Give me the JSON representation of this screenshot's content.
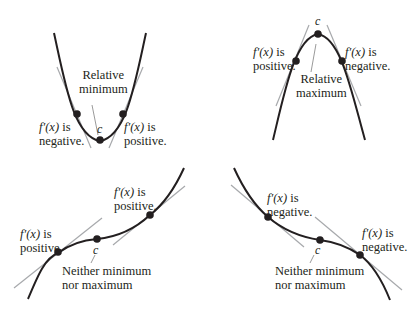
{
  "panels": [
    {
      "name": "relative-minimum",
      "point_label": "c",
      "center_label": [
        "Relative",
        "minimum"
      ],
      "left_label": {
        "fx": "f′(x)",
        "suffix": " is",
        "line2": "negative."
      },
      "right_label": {
        "fx": "f′(x)",
        "suffix": " is",
        "line2": "positive."
      }
    },
    {
      "name": "relative-maximum",
      "point_label": "c",
      "center_label": [
        "Relative",
        "maximum"
      ],
      "left_label": {
        "fx": "f′(x)",
        "suffix": " is",
        "line2": "positive."
      },
      "right_label": {
        "fx": "f′(x)",
        "suffix": " is",
        "line2": "negative."
      }
    },
    {
      "name": "increasing-inflection",
      "point_label": "c",
      "center_label": [
        "Neither minimum",
        "nor maximum"
      ],
      "left_label": {
        "fx": "f′(x)",
        "suffix": " is",
        "line2": "positive."
      },
      "right_label": {
        "fx": "f′(x)",
        "suffix": " is",
        "line2": "positive."
      }
    },
    {
      "name": "decreasing-inflection",
      "point_label": "c",
      "center_label": [
        "Neither minimum",
        "nor maximum"
      ],
      "left_label": {
        "fx": "f′(x)",
        "suffix": " is",
        "line2": "negative."
      },
      "right_label": {
        "fx": "f′(x)",
        "suffix": " is",
        "line2": "negative."
      }
    }
  ],
  "colors": {
    "curve": "#231f20",
    "tangent": "#a7a9ac",
    "leader": "#808080"
  }
}
